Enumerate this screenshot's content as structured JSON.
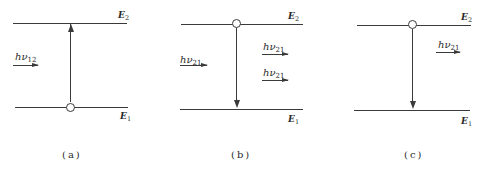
{
  "figure": {
    "panels": [
      {
        "id": "a",
        "caption": "(a)",
        "process": "absorption",
        "upper_level": {
          "label": "E",
          "sub": "2"
        },
        "lower_level": {
          "label": "E",
          "sub": "1"
        },
        "photons_in": [
          {
            "label": "hν",
            "sub": "12"
          }
        ],
        "photons_out": [],
        "atom_position": "lower",
        "transition_direction": "up"
      },
      {
        "id": "b",
        "caption": "(b)",
        "process": "stimulated-emission",
        "upper_level": {
          "label": "E",
          "sub": "2"
        },
        "lower_level": {
          "label": "E",
          "sub": "1"
        },
        "photons_in": [
          {
            "label": "hν",
            "sub": "21"
          }
        ],
        "photons_out": [
          {
            "label": "hν",
            "sub": "21"
          },
          {
            "label": "hν",
            "sub": "21"
          }
        ],
        "atom_position": "upper",
        "transition_direction": "down"
      },
      {
        "id": "c",
        "caption": "(c)",
        "process": "spontaneous-emission",
        "upper_level": {
          "label": "E",
          "sub": "2"
        },
        "lower_level": {
          "label": "E",
          "sub": "1"
        },
        "photons_in": [],
        "photons_out": [
          {
            "label": "hν",
            "sub": "21"
          }
        ],
        "atom_position": "upper",
        "transition_direction": "down"
      }
    ],
    "colors": {
      "line": "#3a3a3a",
      "text": "#2a2a2a",
      "background": "#ffffff"
    }
  }
}
